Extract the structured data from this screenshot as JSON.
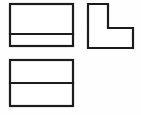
{
  "sheet": {
    "title": "Orthographic Projection Views",
    "width": 141,
    "height": 115,
    "background_color": "#fefefe",
    "line_color": "#1c1c1c",
    "line_width": 2.2,
    "fill_color": "#ffffff"
  },
  "views": {
    "top_view": {
      "name": "Top View",
      "label": "top-view",
      "shape": "rectangle-with-horizontal-division",
      "x": 10,
      "y": 4,
      "width": 63,
      "height": 42,
      "division_y": 34,
      "upper_band_height": 30,
      "lower_band_height": 12
    },
    "right_side_view": {
      "name": "Right Side View",
      "label": "right-side-view",
      "shape": "L-shape",
      "x": 88,
      "y": 4,
      "width": 45,
      "height": 44,
      "vertical_leg_width": 20,
      "horizontal_leg_height": 20,
      "inner_corner_x": 108,
      "inner_corner_y": 28,
      "points": "88,4 108,4 108,28 133,28 133,48 88,48"
    },
    "front_view": {
      "name": "Front View",
      "label": "front-view",
      "shape": "rectangle-with-horizontal-division",
      "x": 10,
      "y": 60,
      "width": 63,
      "height": 46,
      "division_y": 83,
      "upper_band_height": 23,
      "lower_band_height": 23
    }
  }
}
